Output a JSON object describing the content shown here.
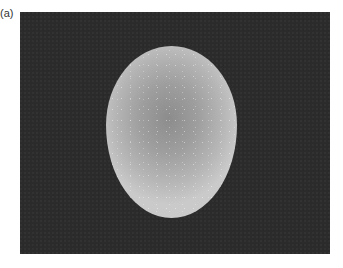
{
  "figure": {
    "panel_label": "(a)",
    "image": {
      "subject": "egg",
      "description": "Photograph of a single egg on a dark background",
      "background_color": "#2b2b2b",
      "egg_edge_color": "#cacaca",
      "egg_center_color": "#8c8c8c"
    }
  }
}
